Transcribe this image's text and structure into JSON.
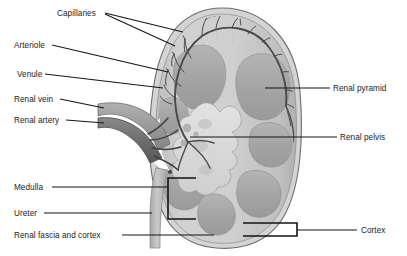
{
  "figure": {
    "orientation": "coronal-section",
    "palette": {
      "background": "#ffffff",
      "capsule_outline": "#6e6e6e",
      "cortex_fill": "#c9c9c9",
      "cortex_light": "#d9d9d9",
      "medulla_pyramid": "#a8a8a8",
      "pyramid_dark": "#9a9a9a",
      "pelvis_fill": "#dcdcdc",
      "vessel_dark": "#4a4a4a",
      "renal_vein": "#9e9e9e",
      "renal_artery": "#6b6b6b",
      "ureter": "#bdbdbd",
      "leader_line": "#151515",
      "label_text": "#1c1c1c"
    }
  },
  "labels": {
    "left": [
      {
        "id": "capillaries",
        "text": "Capillaries",
        "x": 57,
        "y": 9
      },
      {
        "id": "arteriole",
        "text": "Arteriole",
        "x": 14,
        "y": 41
      },
      {
        "id": "venule",
        "text": "Venule",
        "x": 17,
        "y": 70
      },
      {
        "id": "renal-vein",
        "text": "Renal vein",
        "x": 14,
        "y": 95
      },
      {
        "id": "renal-artery",
        "text": "Renal artery",
        "x": 14,
        "y": 116
      },
      {
        "id": "medulla",
        "text": "Medulla",
        "x": 14,
        "y": 183
      },
      {
        "id": "ureter",
        "text": "Ureter",
        "x": 14,
        "y": 209
      },
      {
        "id": "renal-fascia-cortex",
        "text": "Renal fascia and cortex",
        "x": 14,
        "y": 231
      }
    ],
    "right": [
      {
        "id": "renal-pyramid",
        "text": "Renal pyramid",
        "x": 333,
        "y": 84
      },
      {
        "id": "renal-pelvis",
        "text": "Renal pelvis",
        "x": 340,
        "y": 133
      },
      {
        "id": "cortex",
        "text": "Cortex",
        "x": 361,
        "y": 226
      }
    ]
  }
}
